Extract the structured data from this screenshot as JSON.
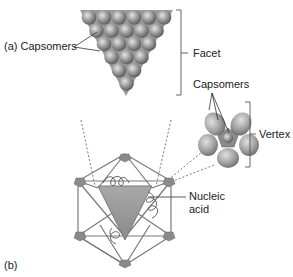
{
  "figure": {
    "panel_a_label": "(a) Capsomers",
    "panel_b_label": "(b)",
    "facet_label": "Facet",
    "capsomers_label": "Capsomers",
    "vertex_label": "Vertex",
    "nucleic_acid_label_line1": "Nucleic",
    "nucleic_acid_label_line2": "acid"
  },
  "colors": {
    "sphere": "#8f8f8f",
    "sphere_highlight": "#d8d8d8",
    "facet_fill": "#9a9a9a",
    "icosahedron_edge": "#7a7a7a",
    "vertex_fill": "#8a8a8a",
    "line": "#333333"
  },
  "facet_rows": [
    6,
    5,
    4,
    3,
    2,
    1
  ]
}
